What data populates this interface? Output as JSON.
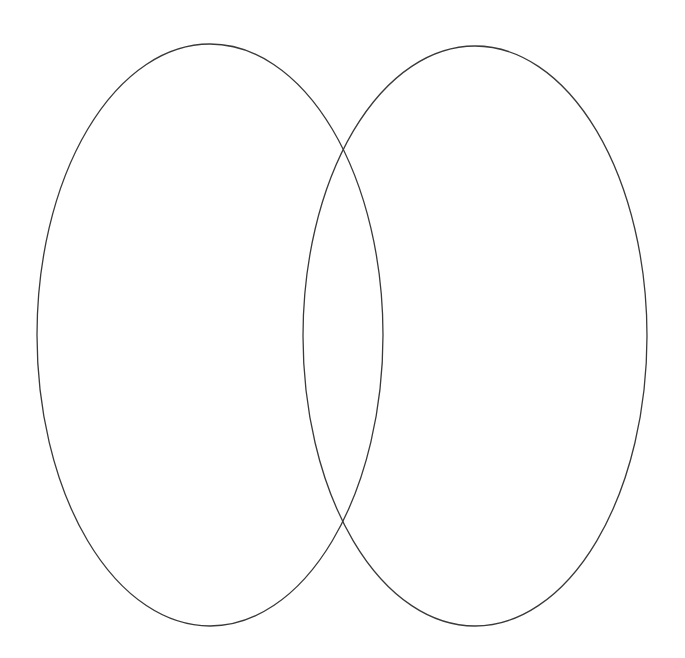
{
  "diagram": {
    "type": "venn",
    "background": "#ffffff",
    "stroke_color": "#3a3a3a",
    "stroke_width": 1.3,
    "sets": [
      {
        "id": "left",
        "label": "",
        "cx": 210,
        "cy": 335,
        "rx": 173,
        "ry": 291
      },
      {
        "id": "right",
        "label": "",
        "cx": 475,
        "cy": 336,
        "rx": 172,
        "ry": 290
      }
    ],
    "intersections": [
      {
        "x": 342,
        "y": 150
      },
      {
        "x": 343,
        "y": 519
      }
    ]
  }
}
